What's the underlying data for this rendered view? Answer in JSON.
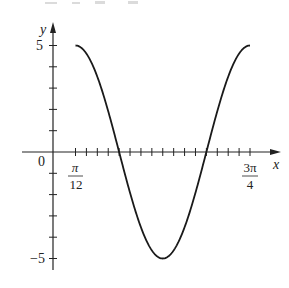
{
  "chart_data": {
    "type": "line",
    "title": "",
    "function": "y = 5cos(3x - π/4)",
    "xlabel": "x",
    "ylabel": "y",
    "x_tick_labels": [
      {
        "label_num": "π",
        "label_den": "12",
        "value": "π/12"
      },
      {
        "label_num": "3π",
        "label_den": "4",
        "value": "3π/4"
      }
    ],
    "origin_label": "0",
    "y_tick_labels": [
      "5",
      "−5"
    ],
    "y_ticks": [
      -5,
      -4,
      -3,
      -2,
      -1,
      1,
      2,
      3,
      4,
      5
    ],
    "xlim": [
      "π/12",
      "3π/4"
    ],
    "ylim": [
      -5,
      5
    ],
    "x_tick_step": "π/24",
    "series": [
      {
        "name": "curve",
        "x": [
          "π/12",
          "π/6",
          "π/4",
          "π/3",
          "5π/12",
          "π/2",
          "7π/12",
          "2π/3",
          "3π/4"
        ],
        "values": [
          5,
          3.54,
          0,
          -3.54,
          -5,
          -3.54,
          0,
          3.54,
          5
        ]
      }
    ],
    "grid": false,
    "legend": null
  },
  "labels": {
    "y_axis": "y",
    "x_axis": "x",
    "origin": "0",
    "y_max": "5",
    "y_min": "−5",
    "x_first_num": "π",
    "x_first_den": "12",
    "x_last_num": "3π",
    "x_last_den": "4"
  },
  "colors": {
    "axis": "#222222",
    "curve": "#1a1a1a",
    "background": "#ffffff"
  }
}
